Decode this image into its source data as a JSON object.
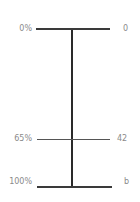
{
  "diagram": {
    "type": "scale-bar",
    "left_labels": [
      "0%",
      "65%",
      "100%"
    ],
    "right_labels": [
      "0",
      "42",
      "b"
    ],
    "ticks": [
      {
        "percent_label": "0%",
        "value_label": "0",
        "position": 0
      },
      {
        "percent_label": "65%",
        "value_label": "42",
        "position": 0.65
      },
      {
        "percent_label": "100%",
        "value_label": "b",
        "position": 1.0
      }
    ],
    "colors": {
      "line": "#3a3a3a",
      "label": "#8a8a8a",
      "background": "#ffffff"
    }
  }
}
